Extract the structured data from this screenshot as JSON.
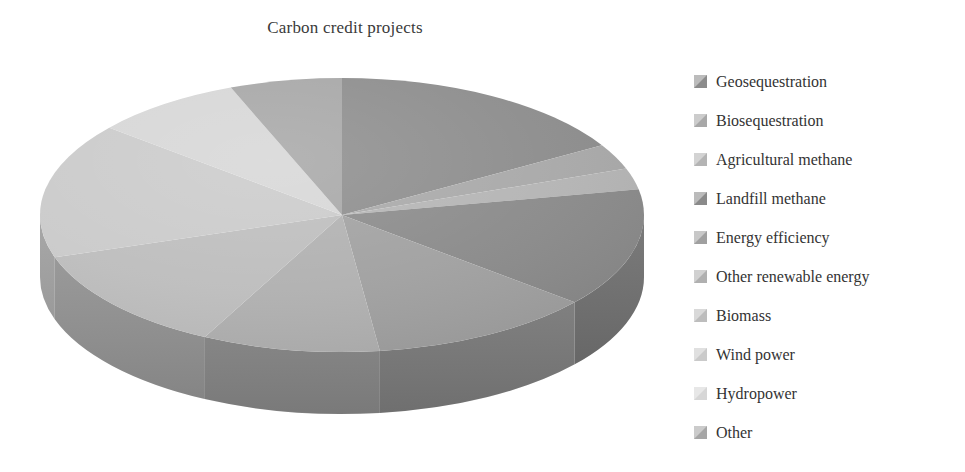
{
  "chart_data": {
    "type": "pie",
    "title": "Carbon credit projects",
    "subtitle": "",
    "xlabel": "",
    "ylabel": "",
    "three_d": true,
    "legend_position": "right",
    "grid": false,
    "start_angle_deg": 0,
    "direction": "clockwise",
    "categories": [
      "Geosequestration",
      "Biosequestration",
      "Agricultural methane",
      "Landfill methane",
      "Energy efficiency",
      "Other renewable energy",
      "Biomass",
      "Wind power",
      "Hydropower",
      "Other"
    ],
    "values": [
      16.5,
      3.0,
      2.5,
      14.0,
      12.0,
      9.5,
      12.5,
      16.0,
      8.0,
      6.0
    ],
    "colors": [
      "#8c8c8c",
      "#a8a8a8",
      "#b4b4b4",
      "#8a8a8a",
      "#a0a0a0",
      "#b0b0b0",
      "#bdbdbd",
      "#cacaca",
      "#d6d6d6",
      "#a6a6a6"
    ],
    "side_colors": [
      "#6e6e6e",
      "#858585",
      "#909090",
      "#6c6c6c",
      "#7e7e7e",
      "#8a8a8a",
      "#949494",
      "#9e9e9e",
      "#a8a8a8",
      "#838383"
    ]
  },
  "title": {
    "text": "Carbon credit projects"
  },
  "legend": {
    "items": [
      {
        "label": "Geosequestration",
        "swatch": "#8c8c8c",
        "icon": "legend-swatch-icon"
      },
      {
        "label": "Biosequestration",
        "swatch": "#a8a8a8",
        "icon": "legend-swatch-icon"
      },
      {
        "label": "Agricultural methane",
        "swatch": "#b4b4b4",
        "icon": "legend-swatch-icon"
      },
      {
        "label": "Landfill methane",
        "swatch": "#8a8a8a",
        "icon": "legend-swatch-icon"
      },
      {
        "label": "Energy efficiency",
        "swatch": "#a0a0a0",
        "icon": "legend-swatch-icon"
      },
      {
        "label": "Other renewable energy",
        "swatch": "#b0b0b0",
        "icon": "legend-swatch-icon"
      },
      {
        "label": "Biomass",
        "swatch": "#bdbdbd",
        "icon": "legend-swatch-icon"
      },
      {
        "label": "Wind power",
        "swatch": "#cacaca",
        "icon": "legend-swatch-icon"
      },
      {
        "label": "Hydropower",
        "swatch": "#d6d6d6",
        "icon": "legend-swatch-icon"
      },
      {
        "label": "Other",
        "swatch": "#a6a6a6",
        "icon": "legend-swatch-icon"
      }
    ]
  },
  "pie_geometry": {
    "cx": 342,
    "cy": 165,
    "rx": 302,
    "ry": 137,
    "depth": 62
  }
}
